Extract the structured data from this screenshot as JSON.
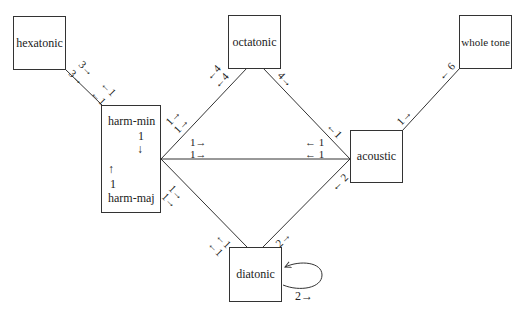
{
  "nodes": {
    "hexatonic": "hexatonic",
    "octatonic": "octatonic",
    "whole_tone": "whole tone",
    "harm_min": "harm-min",
    "harm_maj": "harm-maj",
    "acoustic": "acoustic",
    "diatonic": "diatonic"
  },
  "harm_inner": {
    "min_count": "1",
    "min_arrow": "↓",
    "maj_arrow": "↑",
    "maj_count": "1"
  },
  "edges": {
    "hexatonic_harm": {
      "a": "3→",
      "b": "3→",
      "c": "←1",
      "d": "←1"
    },
    "harmmin_octatonic": {
      "a": "1→",
      "b": "1→",
      "c": "←4",
      "d": "←4"
    },
    "harm_acoustic": {
      "a": "1→",
      "b": "1→",
      "c": "← 1",
      "d": "← 1"
    },
    "harmmaj_diatonic": {
      "a": "1→",
      "b": "1→",
      "c": "←1",
      "d": "←1"
    },
    "octatonic_acoustic": {
      "a": "4→",
      "b": "←1"
    },
    "acoustic_wholetone": {
      "a": "1→",
      "b": "← 6"
    },
    "diatonic_acoustic": {
      "a": "2→",
      "b": "← 2"
    },
    "diatonic_loop": {
      "a": "2→"
    }
  }
}
